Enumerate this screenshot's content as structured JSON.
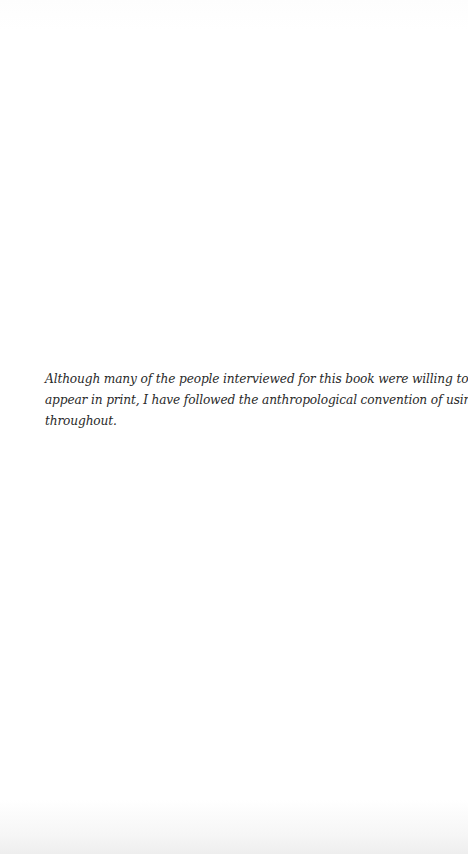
{
  "page": {
    "type": "book-epigraph-note",
    "note_lines": [
      "Although many of the people interviewed for this book were willing to have their names",
      "appear in print, I have followed the anthropological convention of using pseudonyms",
      "throughout."
    ]
  }
}
